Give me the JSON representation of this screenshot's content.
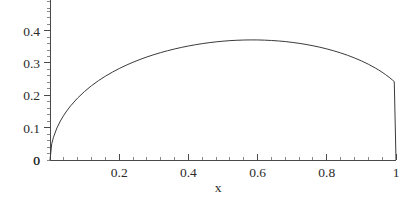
{
  "figure": {
    "background_color": "#ffffff",
    "curve_color": "#3a3a3a",
    "axis_color": "#4a4a4a",
    "text_color": "#2b2b2b"
  },
  "chart_data": {
    "type": "line",
    "title": "",
    "subtitle": "",
    "xlabel": "x",
    "ylabel": "",
    "xlim": [
      0,
      1.0
    ],
    "ylim": [
      0,
      0.47
    ],
    "grid": false,
    "legend": null,
    "legend_position": "none",
    "x_ticks": [
      {
        "value": 0,
        "label": "0"
      },
      {
        "value": 0.2,
        "label": "0.2"
      },
      {
        "value": 0.4,
        "label": "0.4"
      },
      {
        "value": 0.6,
        "label": "0.6"
      },
      {
        "value": 0.8,
        "label": "0.8"
      },
      {
        "value": 1.0,
        "label": "1"
      }
    ],
    "y_ticks": [
      {
        "value": 0,
        "label": "0"
      },
      {
        "value": 0.1,
        "label": "0.1"
      },
      {
        "value": 0.2,
        "label": "0.2"
      },
      {
        "value": 0.3,
        "label": "0.3"
      },
      {
        "value": 0.4,
        "label": "0.4"
      }
    ],
    "x_minor_tick_step": 0.04,
    "y_minor_tick_step": 0.02,
    "series": [
      {
        "name": "curve",
        "color": "#3a3a3a",
        "x": [
          0.0,
          0.005,
          0.01,
          0.02,
          0.03,
          0.04,
          0.05,
          0.06,
          0.08,
          0.1,
          0.12,
          0.14,
          0.16,
          0.18,
          0.2,
          0.22,
          0.24,
          0.26,
          0.28,
          0.3,
          0.32,
          0.34,
          0.36,
          0.38,
          0.4,
          0.42,
          0.44,
          0.46,
          0.48,
          0.5,
          0.52,
          0.54,
          0.56,
          0.58,
          0.6,
          0.62,
          0.64,
          0.66,
          0.68,
          0.7,
          0.72,
          0.74,
          0.76,
          0.78,
          0.8,
          0.82,
          0.84,
          0.86,
          0.88,
          0.9,
          0.92,
          0.94,
          0.95,
          0.96,
          0.97,
          0.98,
          0.99,
          0.995,
          1.0
        ],
        "y": [
          0.0,
          0.0499,
          0.0703,
          0.099,
          0.1206,
          0.1386,
          0.1541,
          0.1679,
          0.1918,
          0.2121,
          0.2298,
          0.2453,
          0.2591,
          0.2715,
          0.2828,
          0.293,
          0.3023,
          0.3108,
          0.3186,
          0.3256,
          0.3321,
          0.338,
          0.3433,
          0.3481,
          0.3525,
          0.3564,
          0.3598,
          0.3628,
          0.3653,
          0.3674,
          0.3691,
          0.3702,
          0.371,
          0.3713,
          0.3712,
          0.3706,
          0.3696,
          0.3681,
          0.3662,
          0.3637,
          0.3608,
          0.3573,
          0.3533,
          0.3487,
          0.3435,
          0.3376,
          0.3311,
          0.3238,
          0.3156,
          0.3065,
          0.2962,
          0.2846,
          0.2782,
          0.2713,
          0.2639,
          0.2559,
          0.2471,
          0.2424,
          0.0
        ],
        "peak_value": 0.46,
        "peak_x": 0.5
      }
    ]
  }
}
